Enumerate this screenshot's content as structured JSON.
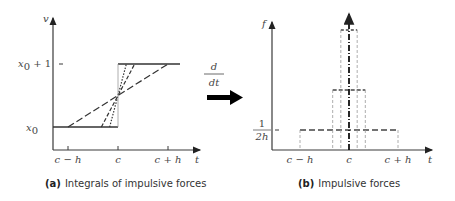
{
  "figure": {
    "arrow_operator": {
      "numerator": "d",
      "denominator": "dt"
    },
    "panels": [
      {
        "id": "a",
        "caption_letter": "(a)",
        "caption_text": "Integrals of impulsive forces",
        "y_axis_label": "v",
        "x_axis_label": "t",
        "x_ticks": [
          "c − h",
          "c",
          "c + h"
        ],
        "y_ticks": [
          {
            "main": "x",
            "sub": "0",
            "suffix": ""
          },
          {
            "main": "x",
            "sub": "0",
            "suffix": " + 1"
          }
        ]
      },
      {
        "id": "b",
        "caption_letter": "(b)",
        "caption_text": "Impulsive forces",
        "y_axis_label": "f",
        "x_axis_label": "t",
        "x_ticks": [
          "c − h",
          "c",
          "c + h"
        ],
        "y_tick_fraction": {
          "numerator": "1",
          "denominator": "2h"
        }
      }
    ]
  },
  "chart_data": [
    {
      "type": "line",
      "title": "Integrals of impulsive forces",
      "xlabel": "t",
      "ylabel": "v",
      "x_ticks": [
        "c-h",
        "c",
        "c+h"
      ],
      "y_ticks": [
        "x0",
        "x0+1"
      ],
      "description": "Ramp functions rising from x0 to x0+1 centered at t=c with varying half-widths",
      "series": [
        {
          "name": "half-width h",
          "style": "long-dash",
          "half_width_fraction_of_h": 1.0
        },
        {
          "name": "half-width h/3",
          "style": "dash",
          "half_width_fraction_of_h": 0.333
        },
        {
          "name": "half-width h/6",
          "style": "dot",
          "half_width_fraction_of_h": 0.167
        },
        {
          "name": "step limit",
          "style": "solid",
          "half_width_fraction_of_h": 0
        }
      ]
    },
    {
      "type": "bar",
      "title": "Impulsive forces",
      "xlabel": "t",
      "ylabel": "f",
      "x_ticks": [
        "c-h",
        "c",
        "c+h"
      ],
      "y_ticks": [
        "1/(2h)"
      ],
      "description": "Rectangular pulses of unit area centered at t=c, narrowing and growing taller, tending to a delta impulse",
      "series": [
        {
          "name": "width 2h",
          "half_width_fraction_of_h": 1.0,
          "height_multiple_of_1_over_2h": 1
        },
        {
          "name": "width 2h/3",
          "half_width_fraction_of_h": 0.333,
          "height_multiple_of_1_over_2h": 3
        },
        {
          "name": "width h/3",
          "half_width_fraction_of_h": 0.167,
          "height_multiple_of_1_over_2h": 6
        },
        {
          "name": "impulse limit",
          "half_width_fraction_of_h": 0,
          "height_multiple_of_1_over_2h": "infinite"
        }
      ]
    }
  ]
}
